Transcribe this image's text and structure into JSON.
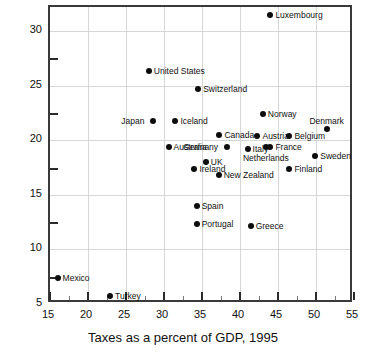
{
  "chart_data": {
    "type": "scatter",
    "title": "",
    "xlabel": "Taxes as a percent of GDP, 1995",
    "ylabel": "",
    "xlim": [
      15,
      55
    ],
    "ylim": [
      5,
      32.2
    ],
    "grid": true,
    "legend": "none",
    "xticks": [
      15,
      20,
      25,
      30,
      35,
      40,
      45,
      50,
      55
    ],
    "xticklabels": [
      "15",
      "20",
      "25",
      "30",
      "35",
      "40",
      "45",
      "50",
      "55"
    ],
    "xminorticks": [
      17.5,
      22.5,
      27.5,
      32.5,
      37.5,
      42.5,
      47.5,
      52.5
    ],
    "yticks": [
      5,
      10,
      15,
      20,
      25,
      30
    ],
    "yticklabels": [
      "5",
      "10",
      "15",
      "20",
      "25",
      "30"
    ],
    "yminorticks": [
      7.5,
      12.5,
      17.5,
      22.5,
      27.5
    ],
    "point_color": "#0d0d0d",
    "points": [
      {
        "label": "Luxembourg",
        "x": 44.0,
        "y": 31.5,
        "pos": "right"
      },
      {
        "label": "United States",
        "x": 28.0,
        "y": 26.3,
        "pos": "right"
      },
      {
        "label": "Switzerland",
        "x": 34.5,
        "y": 24.7,
        "pos": "right"
      },
      {
        "label": "Japan",
        "x": 28.6,
        "y": 21.8,
        "pos": "left"
      },
      {
        "label": "Iceland",
        "x": 31.5,
        "y": 21.8,
        "pos": "right"
      },
      {
        "label": "Norway",
        "x": 43.0,
        "y": 22.4,
        "pos": "right"
      },
      {
        "label": "Denmark",
        "x": 51.4,
        "y": 21.0,
        "pos": "above"
      },
      {
        "label": "Canada",
        "x": 37.3,
        "y": 20.5,
        "pos": "right"
      },
      {
        "label": "Austria",
        "x": 42.3,
        "y": 20.4,
        "pos": "right"
      },
      {
        "label": "Belgium",
        "x": 46.5,
        "y": 20.4,
        "pos": "right"
      },
      {
        "label": "Australia",
        "x": 30.6,
        "y": 19.4,
        "pos": "right"
      },
      {
        "label": "Germany",
        "x": 38.3,
        "y": 19.4,
        "pos": "left"
      },
      {
        "label": "Italy",
        "x": 41.0,
        "y": 19.2,
        "pos": "right"
      },
      {
        "label": "France",
        "x": 44.0,
        "y": 19.4,
        "pos": "right"
      },
      {
        "label": "Netherlands",
        "x": 43.4,
        "y": 19.4,
        "pos": "below"
      },
      {
        "label": "Sweden",
        "x": 49.9,
        "y": 18.6,
        "pos": "right"
      },
      {
        "label": "UK",
        "x": 35.5,
        "y": 18.0,
        "pos": "right"
      },
      {
        "label": "Ireland",
        "x": 34.0,
        "y": 17.4,
        "pos": "right"
      },
      {
        "label": "Finland",
        "x": 46.5,
        "y": 17.4,
        "pos": "right"
      },
      {
        "label": "New Zealand",
        "x": 37.2,
        "y": 16.8,
        "pos": "right"
      },
      {
        "label": "Spain",
        "x": 34.3,
        "y": 14.0,
        "pos": "right"
      },
      {
        "label": "Portugal",
        "x": 34.3,
        "y": 12.3,
        "pos": "right"
      },
      {
        "label": "Greece",
        "x": 41.4,
        "y": 12.1,
        "pos": "right"
      },
      {
        "label": "Mexico",
        "x": 16.0,
        "y": 7.4,
        "pos": "right"
      },
      {
        "label": "Turkey",
        "x": 22.9,
        "y": 5.7,
        "pos": "right"
      }
    ]
  }
}
